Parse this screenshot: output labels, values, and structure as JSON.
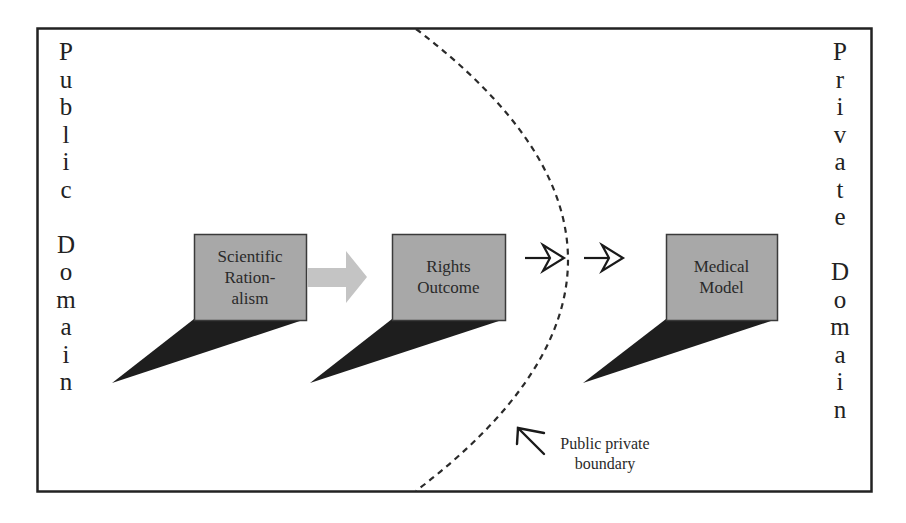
{
  "diagram": {
    "left_domain_label": "Public Domain",
    "left_domain_letters": [
      "P",
      "u",
      "b",
      "l",
      "i",
      "c",
      "",
      "D",
      "o",
      "m",
      "a",
      "i",
      "n"
    ],
    "right_domain_label": "Private Domain",
    "right_domain_letters": [
      "P",
      "r",
      "i",
      "v",
      "a",
      "t",
      "e",
      "",
      "D",
      "o",
      "m",
      "a",
      "i",
      "n"
    ],
    "boxes": [
      {
        "id": "scientific-rationalism",
        "lines": [
          "Scientific",
          "Ration-",
          "alism"
        ]
      },
      {
        "id": "rights-outcome",
        "lines": [
          "Rights",
          "Outcome"
        ]
      },
      {
        "id": "medical-model",
        "lines": [
          "Medical",
          "Model"
        ]
      }
    ],
    "boundary_caption": {
      "lines": [
        "Public private",
        "boundary"
      ]
    },
    "colors": {
      "box_fill": "#a8a8a8",
      "box_border": "#3a3a3a",
      "shadow": "#1e1e1e",
      "block_arrow": "#c4c4c4",
      "frame": "#222222",
      "dashed_boundary": "#2a2a2a"
    }
  }
}
